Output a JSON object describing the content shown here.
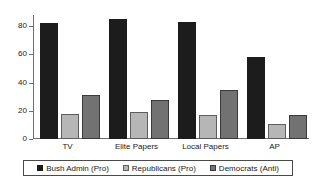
{
  "chart_data": {
    "type": "bar",
    "title": "",
    "subtitle": "",
    "xlabel": "",
    "ylabel": "",
    "categories": [
      "TV",
      "Elite Papers",
      "Local Papers",
      "AP"
    ],
    "series": [
      {
        "name": "Bush Admin (Pro)",
        "color": "#1c1c1c",
        "values": [
          82,
          85,
          83,
          58
        ]
      },
      {
        "name": "Republicans (Pro)",
        "color": "#b6b6b6",
        "values": [
          18,
          19,
          17,
          11
        ]
      },
      {
        "name": "Democrats (Anti)",
        "color": "#727272",
        "values": [
          31,
          28,
          35,
          17
        ]
      }
    ],
    "ylim": [
      0,
      88
    ],
    "yticks": [
      0,
      20,
      40,
      60,
      80
    ],
    "ytick_labels": [
      "0",
      "20",
      "40",
      "60",
      "80"
    ],
    "grid": false,
    "legend_position": "bottom"
  }
}
